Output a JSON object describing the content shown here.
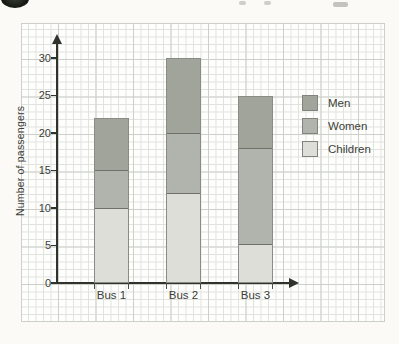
{
  "artifacts": {
    "cropped_question_bubble": "partially visible dark circle, top-left corner",
    "cropped_text_marks": "faint remnants of cropped text along top edge"
  },
  "colors": {
    "axis": "#30332c",
    "text": "#3a3d35",
    "grid_minor": "#e0e2dd",
    "grid_major": "#cdd0ca",
    "paper": "#fefefd",
    "page_background": "#fbfaf7",
    "bar_outline": "#888c83",
    "segment_divider": "#6d716a"
  },
  "chart_data": {
    "type": "bar",
    "stacked": true,
    "title": "",
    "ylabel": "Number of passengers",
    "xlabel": "",
    "categories": [
      "Bus 1",
      "Bus 2",
      "Bus 3"
    ],
    "series": [
      {
        "name": "Children",
        "values": [
          10,
          12,
          5
        ],
        "color": "#dcded7"
      },
      {
        "name": "Women",
        "values": [
          5,
          8,
          13
        ],
        "color": "#b0b4ac"
      },
      {
        "name": "Men",
        "values": [
          7,
          10,
          7
        ],
        "color": "#a0a49b"
      }
    ],
    "stack_totals": [
      22,
      30,
      25
    ],
    "ylim": [
      0,
      32
    ],
    "yticks": [
      0,
      5,
      10,
      15,
      20,
      25,
      30
    ],
    "grid": true,
    "legend_position": "right-middle",
    "legend_order": [
      "Men",
      "Women",
      "Children"
    ]
  }
}
